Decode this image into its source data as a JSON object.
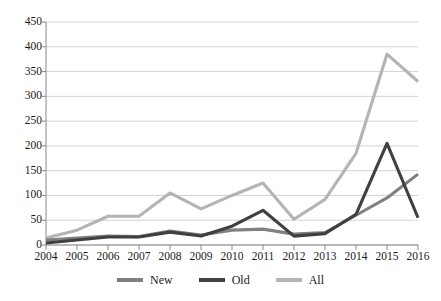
{
  "chart_data": {
    "type": "line",
    "title": "",
    "xlabel": "",
    "ylabel": "",
    "x": [
      2004,
      2005,
      2006,
      2007,
      2008,
      2009,
      2010,
      2011,
      2012,
      2013,
      2014,
      2015,
      2016
    ],
    "categories": [
      "2004",
      "2005",
      "2006",
      "2007",
      "2008",
      "2009",
      "2010",
      "2011",
      "2012",
      "2013",
      "2014",
      "2015",
      "2016"
    ],
    "series": [
      {
        "name": "New",
        "color": "#808080",
        "values": [
          10,
          14,
          18,
          17,
          28,
          20,
          30,
          32,
          22,
          25,
          60,
          95,
          143
        ]
      },
      {
        "name": "Old",
        "color": "#404040",
        "values": [
          4,
          10,
          16,
          16,
          26,
          18,
          38,
          70,
          18,
          23,
          62,
          205,
          55
        ]
      },
      {
        "name": "All",
        "color": "#b4b4b4",
        "values": [
          14,
          30,
          58,
          58,
          105,
          73,
          100,
          125,
          52,
          92,
          185,
          385,
          330
        ]
      }
    ],
    "ylim": [
      0,
      450
    ],
    "yticks": [
      0,
      50,
      100,
      150,
      200,
      250,
      300,
      350,
      400,
      450
    ],
    "ytick_labels": [
      "0",
      "50",
      "100",
      "150",
      "200",
      "250",
      "300",
      "350",
      "400",
      "450"
    ],
    "grid": true,
    "grid_axis": "y",
    "legend_position": "bottom",
    "legend": [
      "New",
      "Old",
      "All"
    ]
  },
  "colors": {
    "new": "#808080",
    "old": "#404040",
    "all": "#b4b4b4",
    "gridline": "#c8c8c8",
    "axis": "#8a8a8a",
    "text": "#1a1a1a",
    "background": "#ffffff"
  }
}
